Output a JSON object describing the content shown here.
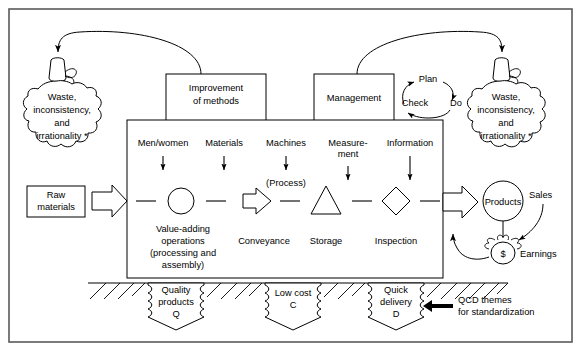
{
  "diagram": {
    "title_present": false,
    "boxes": {
      "improvement": "Improvement\nof methods",
      "improvement_line1": "Improvement",
      "improvement_line2": "of methods",
      "management": "Management",
      "raw_materials_line1": "Raw",
      "raw_materials_line2": "materials"
    },
    "waste_bag_left": {
      "line1": "Waste,",
      "line2": "inconsistency,",
      "line3": "and",
      "line4": "irrationality *"
    },
    "waste_bag_right": {
      "line1": "Waste,",
      "line2": "inconsistency,",
      "line3": "and",
      "line4": "irrationality *"
    },
    "pdca": {
      "plan": "Plan",
      "do": "Do",
      "check": "Check"
    },
    "inputs": [
      {
        "label_line1": "Men/women",
        "label_line2": ""
      },
      {
        "label_line1": "Materials",
        "label_line2": ""
      },
      {
        "label_line1": "Machines",
        "label_line2": ""
      },
      {
        "label_line1": "Measure-",
        "label_line2": "ment"
      },
      {
        "label_line1": "Information",
        "label_line2": ""
      }
    ],
    "process_note": "(Process)",
    "symbols": [
      {
        "name": "operation-circle",
        "label_line1": "Value-adding",
        "label_line2": "operations",
        "label_line3": "(processing and",
        "label_line4": "assembly)"
      },
      {
        "name": "conveyance-arrow",
        "label_line1": "Conveyance"
      },
      {
        "name": "storage-triangle",
        "label_line1": "Storage"
      },
      {
        "name": "inspection-diamond",
        "label_line1": "Inspection"
      }
    ],
    "output": {
      "products": "Products",
      "sales": "Sales",
      "earnings": "Earnings",
      "money_symbol": "$"
    },
    "qcd_banners": [
      {
        "line1": "Quality",
        "line2": "products",
        "line3": "Q"
      },
      {
        "line1": "Low cost",
        "line2": "C",
        "line3": ""
      },
      {
        "line1": "Quick",
        "line2": "delivery",
        "line3": "D"
      }
    ],
    "qcd_callout": {
      "line1": "QCD themes",
      "line2": "for standardization"
    },
    "colors": {
      "stroke": "#000000",
      "frame": "#5a5a5a",
      "background": "#ffffff"
    }
  }
}
